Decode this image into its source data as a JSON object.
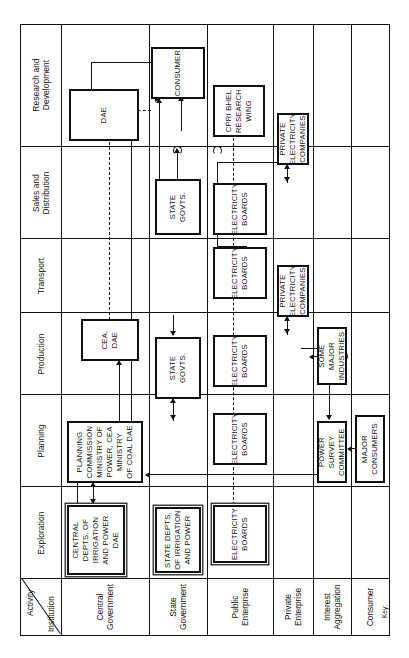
{
  "diagram": {
    "corner": {
      "activity_label": "Activity",
      "institution_label": "Institution"
    },
    "key_label": "Key:",
    "columns": [
      {
        "id": "exploration",
        "label": "Exploration"
      },
      {
        "id": "planning",
        "label": "Planning"
      },
      {
        "id": "production",
        "label": "Production"
      },
      {
        "id": "transport",
        "label": "Transport"
      },
      {
        "id": "sales",
        "label": "Sales and\nDistribution"
      },
      {
        "id": "research",
        "label": "Research and\nDevelopment"
      }
    ],
    "rows": [
      {
        "id": "central-government",
        "label": "Central\nGovernment"
      },
      {
        "id": "state-government",
        "label": "State\nGovernment"
      },
      {
        "id": "public-enterprise",
        "label": "Public\nEnterprise"
      },
      {
        "id": "private-enterprise",
        "label": "Private\nEnterprise"
      },
      {
        "id": "interest-aggregation",
        "label": "Interest\nAggregation"
      },
      {
        "id": "consumer",
        "label": "Consumer"
      }
    ],
    "nodes": [
      {
        "id": "central-depts",
        "row": "central-government",
        "column": "exploration",
        "label": "CENTRAL\nDEPTS. OF\nIRRIGATION\nAND POWER\nDAE"
      },
      {
        "id": "planning-commission",
        "row": "central-government",
        "column": "planning",
        "label": "PLANNING COMMISSION\nMINISTRY OF\nPOWER, CEA MINISTRY\nOF COAL DAE"
      },
      {
        "id": "cea-dae",
        "row": "central-government",
        "column": "production",
        "label": "CEA, DAE"
      },
      {
        "id": "dae",
        "row": "central-government",
        "column": "research",
        "label": "DAE"
      },
      {
        "id": "state-depts",
        "row": "state-government",
        "column": "exploration",
        "label": "STATE DEPTS.\nOF IRRIGATION\nAND POWER"
      },
      {
        "id": "state-govts-planning",
        "row": "state-government",
        "column": "planning",
        "label": "STATE GOVTS."
      },
      {
        "id": "state-govts-sales",
        "row": "state-government",
        "column": "sales",
        "label": "STATE GOVTS."
      },
      {
        "id": "eb-exploration",
        "row": "public-enterprise",
        "column": "exploration",
        "label": "ELECTRICITY\nBOARDS"
      },
      {
        "id": "eb-planning",
        "row": "public-enterprise",
        "column": "planning",
        "label": "ELECTRICITY\nBOARDS"
      },
      {
        "id": "eb-production",
        "row": "public-enterprise",
        "column": "production",
        "label": "ELECTRICITY\nBOARDS"
      },
      {
        "id": "eb-transport",
        "row": "public-enterprise",
        "column": "transport",
        "label": "ELECTRICITY\nBOARDS"
      },
      {
        "id": "eb-sales",
        "row": "public-enterprise",
        "column": "sales",
        "label": "ELECTRICITY\nBOARDS"
      },
      {
        "id": "cpri-bhel",
        "row": "public-enterprise",
        "column": "research",
        "label": "CPRI   BHEL\nRESEARCH\nWING"
      },
      {
        "id": "pec-production",
        "row": "private-enterprise",
        "column": "production",
        "label": "PRIVATE\nELECTRICITY\nCOMPANIES"
      },
      {
        "id": "pec-sales",
        "row": "private-enterprise",
        "column": "sales",
        "label": "PRIVATE\nELECTRICITY\nCOMPANIES"
      },
      {
        "id": "power-survey",
        "row": "interest-aggregation",
        "column": "planning",
        "label": "POWER SURVEY\nCOMMITTEE"
      },
      {
        "id": "some-major-industries",
        "row": "interest-aggregation",
        "column": "production",
        "label": "SOME MAJOR\nINDUSTRIES"
      },
      {
        "id": "major-consumers",
        "row": "consumer",
        "column": "planning",
        "label": "MAJOR CONSUMERS"
      },
      {
        "id": "consumer-sales",
        "row": "consumer",
        "column": "sales",
        "label": "CONSUMER"
      }
    ],
    "edges": [
      {
        "from": "central-depts",
        "to": "planning-commission",
        "style": "solid",
        "direction": "both"
      },
      {
        "from": "planning-commission",
        "to": "cea-dae",
        "style": "solid",
        "direction": "up"
      },
      {
        "from": "planning-commission",
        "to": "dae",
        "style": "solid",
        "direction": "down"
      },
      {
        "from": "cea-dae",
        "to": "dae",
        "style": "dashed",
        "direction": "none"
      },
      {
        "from": "state-depts",
        "to": "planning-commission",
        "style": "solid",
        "direction": "to"
      },
      {
        "from": "planning-commission",
        "to": "state-govts-planning",
        "style": "solid",
        "direction": "both"
      },
      {
        "from": "eb-exploration",
        "to": "eb-planning",
        "style": "dashed",
        "direction": "none"
      },
      {
        "from": "eb-planning",
        "to": "state-govts-planning",
        "style": "solid",
        "direction": "to"
      },
      {
        "from": "eb-planning",
        "to": "eb-production",
        "style": "dashed",
        "direction": "none"
      },
      {
        "from": "eb-production",
        "to": "pec-production",
        "style": "solid",
        "direction": "both"
      },
      {
        "from": "eb-production",
        "to": "eb-transport",
        "style": "dashed",
        "direction": "none"
      },
      {
        "from": "eb-transport",
        "to": "eb-sales",
        "style": "dashed",
        "direction": "none"
      },
      {
        "from": "state-govts-sales",
        "to": "eb-sales",
        "style": "solid",
        "direction": "to"
      },
      {
        "from": "eb-sales",
        "to": "pec-sales",
        "style": "solid",
        "direction": "both"
      },
      {
        "from": "cpri-bhel",
        "to": "eb-sales",
        "style": "dashed",
        "direction": "none"
      },
      {
        "from": "cpri-bhel",
        "to": "dae",
        "style": "solid",
        "direction": "to"
      },
      {
        "from": "pec-sales",
        "to": "consumer-sales",
        "style": "solid",
        "direction": "to"
      },
      {
        "from": "eb-sales",
        "to": "consumer-sales",
        "style": "solid",
        "direction": "to"
      },
      {
        "from": "pec-production",
        "to": "power-survey",
        "style": "solid",
        "direction": "to"
      },
      {
        "from": "major-consumers",
        "to": "power-survey",
        "style": "solid",
        "direction": "to"
      },
      {
        "from": "major-consumers",
        "to": "some-major-industries",
        "style": "solid",
        "direction": "to"
      },
      {
        "from": "power-survey",
        "to": "planning-commission",
        "style": "solid",
        "direction": "to"
      },
      {
        "from": "consumer-sales",
        "to": "cpri-bhel",
        "style": "solid",
        "direction": "to"
      }
    ],
    "colors": {
      "line": "#111111",
      "background": "#ffffff",
      "text": "#111111"
    }
  }
}
